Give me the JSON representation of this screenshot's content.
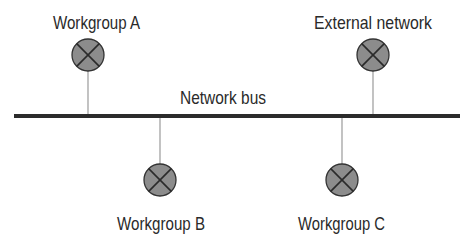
{
  "diagram": {
    "type": "network-bus-topology",
    "bus": {
      "label": "Network bus",
      "x1": 14,
      "x2": 460,
      "y": 116,
      "thickness": 4,
      "color": "#2b2b2b",
      "label_pos": {
        "x": 180,
        "y": 104,
        "width": 86
      }
    },
    "node_style": {
      "radius": 16,
      "fill": "#8c8c8c",
      "stroke": "#333333",
      "cross_color": "#2a2a2a",
      "connector_color": "#9a9a9a"
    },
    "nodes": [
      {
        "id": "workgroup-a",
        "label": "Workgroup A",
        "cx": 88,
        "cy": 55,
        "side": "above",
        "label_pos": {
          "x": 53,
          "y": 29,
          "width": 87
        }
      },
      {
        "id": "external-network",
        "label": "External network",
        "cx": 373,
        "cy": 55,
        "side": "above",
        "label_pos": {
          "x": 314,
          "y": 29,
          "width": 118
        }
      },
      {
        "id": "workgroup-b",
        "label": "Workgroup B",
        "cx": 160,
        "cy": 180,
        "side": "below",
        "label_pos": {
          "x": 117,
          "y": 230,
          "width": 88
        }
      },
      {
        "id": "workgroup-c",
        "label": "Workgroup C",
        "cx": 342,
        "cy": 180,
        "side": "below",
        "label_pos": {
          "x": 298,
          "y": 230,
          "width": 87
        }
      }
    ]
  }
}
